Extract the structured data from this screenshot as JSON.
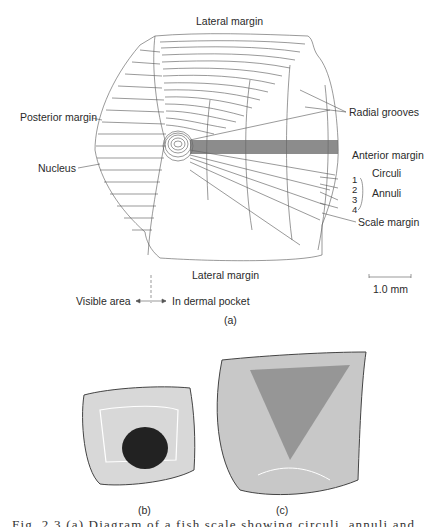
{
  "figure": {
    "panel_a": {
      "label": "(a)",
      "labels": {
        "lateral_margin_top": "Lateral margin",
        "lateral_margin_bottom": "Lateral margin",
        "posterior_margin": "Posterior margin",
        "nucleus": "Nucleus",
        "radial_grooves": "Radial grooves",
        "anterior_margin": "Anterior margin",
        "circuli": "Circuli",
        "annuli": "Annuli",
        "scale_margin": "Scale margin"
      },
      "annuli_numbers": [
        "1",
        "2",
        "3",
        "4"
      ],
      "scale_bar": "1.0 mm",
      "orientation": {
        "visible_area": "Visible area",
        "in_dermal_pocket": "In dermal pocket"
      }
    },
    "panel_b": {
      "label": "(b)"
    },
    "panel_c": {
      "label": "(c)"
    },
    "caption_cutoff": "Fig. 2.3  (a) Diagram of a fish scale showing circuli, annuli and radial grooves"
  },
  "colors": {
    "ink": "#2a2a2a",
    "paper": "#ffffff"
  }
}
